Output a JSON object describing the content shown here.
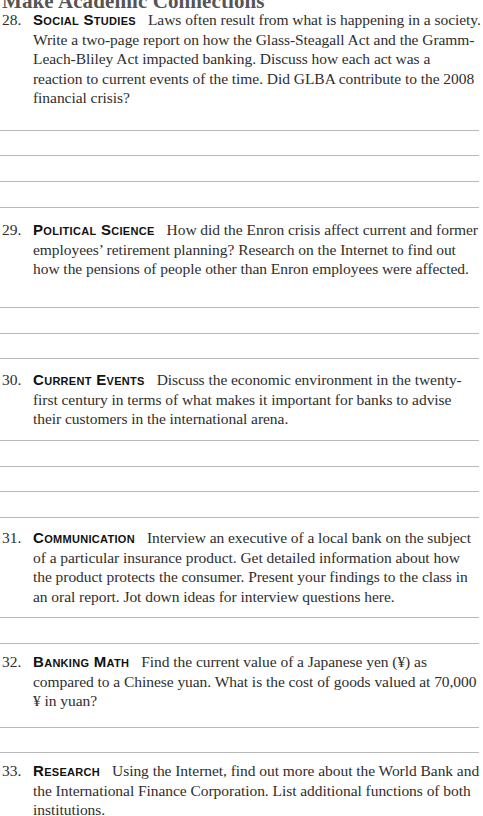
{
  "page": {
    "title": "Make Academic Connections"
  },
  "questions": [
    {
      "number": "28.",
      "subject": "Social Studies",
      "text": "Laws often result from what is happening in a society. Write a two-page report on how the Glass-Steagall Act and the Gramm-Leach-Bliley Act impacted banking. Discuss how each act was a reaction to current events of the time. Did GLBA contribute to the 2008 financial crisis?",
      "answer_lines": 4
    },
    {
      "number": "29.",
      "subject": "Political Science",
      "text": "How did the Enron crisis affect current and former employees’ retirement planning? Research on the Internet to find out how the pensions of people other than Enron employees were affected.",
      "answer_lines": 3
    },
    {
      "number": "30.",
      "subject": "Current Events",
      "text": "Discuss the economic environment in the twenty-first century in terms of what makes it important for banks to advise their customers in the international arena.",
      "answer_lines": 4
    },
    {
      "number": "31.",
      "subject": "Communication",
      "text": "Interview an executive of a local bank on the subject of a particular insurance product. Get detailed information about how the product protects the consumer. Present your findings to the class in an oral report. Jot down ideas for interview questions here.",
      "answer_lines": 2
    },
    {
      "number": "32.",
      "subject": "Banking Math",
      "text": "Find the current value of a Japanese yen (¥) as compared to a Chinese yuan. What is the cost of goods valued at 70,000 ¥ in yuan?",
      "answer_lines": 2
    },
    {
      "number": "33.",
      "subject": "Research",
      "text": "Using the Internet, find out more about the World Bank and the International Finance Corporation. List additional functions of both institutions.",
      "answer_lines": 0
    }
  ]
}
